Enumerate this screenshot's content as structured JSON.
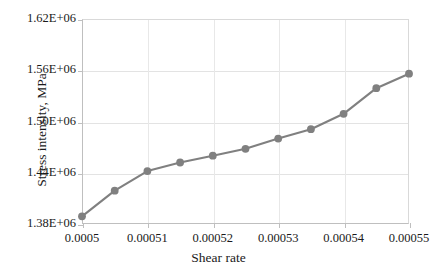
{
  "chart_data": {
    "type": "line",
    "title": "",
    "xlabel": "Shear rate",
    "ylabel": "Stress intensity, MPa",
    "xlim": [
      0.0005,
      0.00055
    ],
    "ylim": [
      1380000,
      1620000
    ],
    "grid": true,
    "legend": "none",
    "marker": "circle",
    "series_color": "#808080",
    "x": [
      0.0005,
      0.000505,
      0.00051,
      0.000515,
      0.00052,
      0.000525,
      0.00053,
      0.000535,
      0.00054,
      0.000545,
      0.00055
    ],
    "values": [
      1389000,
      1419000,
      1442000,
      1452000,
      1460000,
      1468000,
      1480000,
      1491000,
      1509000,
      1539000,
      1556000
    ],
    "series": [
      {
        "name": "Stress intensity",
        "values": [
          1389000,
          1419000,
          1442000,
          1452000,
          1460000,
          1468000,
          1480000,
          1491000,
          1509000,
          1539000,
          1556000
        ]
      }
    ],
    "ytick_labels": [
      "1.62E+06",
      "1.56E+06",
      "1.50E+06",
      "1.44E+06",
      "1.38E+06"
    ],
    "ytick_values": [
      1620000,
      1560000,
      1500000,
      1440000,
      1380000
    ],
    "xtick_labels": [
      "0.0005",
      "0.00051",
      "0.00052",
      "0.00053",
      "0.00054",
      "0.00055"
    ],
    "xtick_values": [
      0.0005,
      0.00051,
      0.00052,
      0.00053,
      0.00054,
      0.00055
    ]
  },
  "axis": {
    "x_title": "Shear rate",
    "y_title": "Stress intensity, MPa"
  },
  "colors": {
    "series": "#808080",
    "grid": "#e3e3e3",
    "axis": "#bfbfbf",
    "text": "#1a1a1a",
    "background": "#ffffff"
  }
}
